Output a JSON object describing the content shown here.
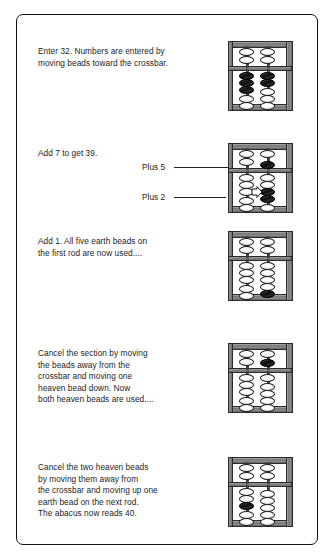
{
  "document": {
    "title": "Abacus addition worked example",
    "border_color": "#111111",
    "background": "#ffffff"
  },
  "panels": [
    {
      "id": "panel-enter-32",
      "text": "Enter 32. Numbers are entered by\nmoving beads toward the crossbar.",
      "abacus": {
        "name": "abacus-enter-32",
        "reads": "32",
        "rods": [
          {
            "label": "tens-rod",
            "heaven": [
              "open",
              "open"
            ],
            "earth": [
              "filled",
              "filled",
              "filled",
              "open",
              "open"
            ]
          },
          {
            "label": "ones-rod",
            "heaven": [
              "open",
              "open"
            ],
            "earth": [
              "filled",
              "filled",
              "open",
              "open",
              "open"
            ]
          }
        ]
      },
      "callouts": []
    },
    {
      "id": "panel-add-7",
      "text": "Add 7 to get 39.",
      "abacus": {
        "name": "abacus-add-7",
        "reads": "39",
        "rods": [
          {
            "label": "tens-rod",
            "heaven": [
              "open",
              "open"
            ],
            "earth": [
              "open",
              "open",
              "open",
              "open",
              "open"
            ]
          },
          {
            "label": "ones-rod",
            "heaven": [
              "open",
              "filled"
            ],
            "earth": [
              "open",
              "open",
              "filled",
              "filled",
              "open"
            ]
          }
        ]
      },
      "callouts": [
        {
          "name": "callout-plus-5",
          "label": "Plus 5"
        },
        {
          "name": "callout-plus-2",
          "label": "Plus 2"
        }
      ]
    },
    {
      "id": "panel-add-1",
      "text": "Add 1. All five earth beads on\nthe first rod are now used....",
      "abacus": {
        "name": "abacus-add-1",
        "reads": "40 pending",
        "rods": [
          {
            "label": "tens-rod",
            "heaven": [
              "open",
              "open"
            ],
            "earth": [
              "open",
              "open",
              "open",
              "open",
              "open"
            ]
          },
          {
            "label": "ones-rod",
            "heaven": [
              "open",
              "open"
            ],
            "earth": [
              "open",
              "open",
              "open",
              "open",
              "filled"
            ]
          }
        ]
      },
      "callouts": []
    },
    {
      "id": "panel-cancel-section",
      "text": "Cancel the section by moving\nthe beads away from the\ncrossbar and moving one\nheaven bead down. Now\nboth heaven beads are used....",
      "abacus": {
        "name": "abacus-cancel-section",
        "reads": "40 pending",
        "rods": [
          {
            "label": "tens-rod",
            "heaven": [
              "open",
              "open"
            ],
            "earth": [
              "open",
              "open",
              "open",
              "open",
              "open"
            ]
          },
          {
            "label": "ones-rod",
            "heaven": [
              "open",
              "filled"
            ],
            "earth": [
              "open",
              "open",
              "open",
              "open",
              "open"
            ]
          }
        ]
      },
      "callouts": []
    },
    {
      "id": "panel-cancel-heaven",
      "text": "Cancel the two heaven beads\nby moving them away from\nthe crossbar and moving up one\nearth bead on the next rod.\nThe abacus now reads 40.",
      "abacus": {
        "name": "abacus-reads-40",
        "reads": "40",
        "rods": [
          {
            "label": "tens-rod",
            "heaven": [
              "open",
              "open"
            ],
            "earth": [
              "open",
              "open",
              "filled",
              "open",
              "open"
            ]
          },
          {
            "label": "ones-rod",
            "heaven": [
              "open",
              "open"
            ],
            "earth": [
              "open",
              "open",
              "open",
              "open",
              "open"
            ]
          }
        ]
      },
      "callouts": []
    }
  ],
  "colors": {
    "bead_active": "#141414",
    "bead_inactive": "#ffffff",
    "frame_wood": "#8b8b8b",
    "rod": "#4a4a4a",
    "text": "#1d1d1d"
  }
}
